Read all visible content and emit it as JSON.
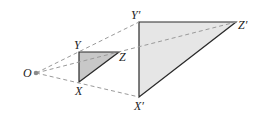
{
  "diagram": {
    "colors": {
      "dashed_ray": "#9a9a9a",
      "triangle_edge": "#2a2a2a",
      "small_fill": "#c8c8c8",
      "large_fill": "#e6e6e6",
      "center_dot": "#8a8a8a",
      "label": "#222222"
    },
    "labels": {
      "O": "O",
      "X": "X",
      "Y": "Y",
      "Z": "Z",
      "X_prime": "X′",
      "Y_prime": "Y′",
      "Z_prime": "Z′"
    },
    "points": {
      "O": [
        36,
        73
      ],
      "X": [
        79,
        82
      ],
      "Y": [
        79,
        52
      ],
      "Z": [
        119,
        52
      ],
      "X_prime": [
        139,
        97
      ],
      "Y_prime": [
        139,
        22
      ],
      "Z_prime": [
        236,
        22
      ]
    },
    "small_triangle": [
      "X",
      "Y",
      "Z"
    ],
    "large_triangle": [
      "X_prime",
      "Y_prime",
      "Z_prime"
    ],
    "rays": [
      [
        "O",
        "X_prime"
      ],
      [
        "O",
        "Y_prime"
      ],
      [
        "O",
        "Z_prime"
      ]
    ]
  }
}
